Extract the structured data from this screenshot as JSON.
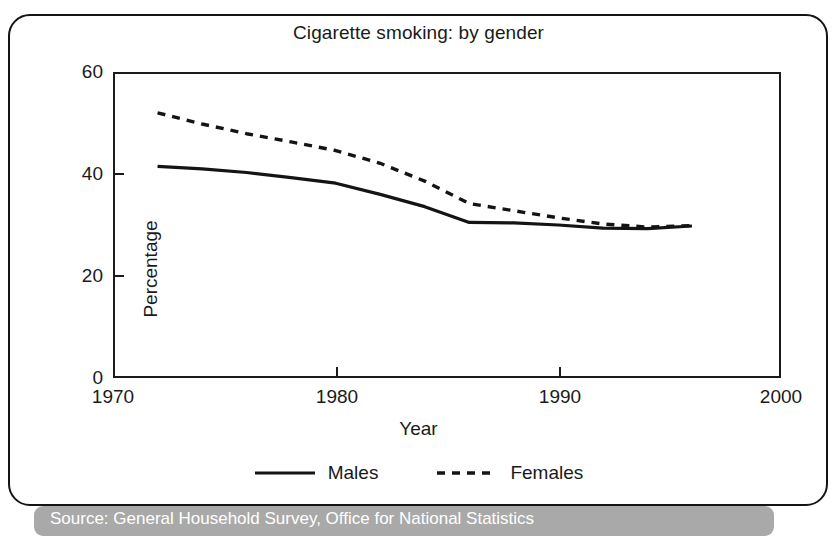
{
  "figure": {
    "title": "Cigarette smoking: by gender",
    "source_text": "Source: General Household Survey, Office for National Statistics"
  },
  "axes": {
    "x_title": "Year",
    "y_title": "Percentage",
    "x_ticks": [
      "1970",
      "1980",
      "1990",
      "2000"
    ],
    "y_ticks": [
      "60",
      "40",
      "20",
      "0"
    ]
  },
  "legend": {
    "items": [
      {
        "label": "Males",
        "style": "solid"
      },
      {
        "label": "Females",
        "style": "dotted"
      }
    ]
  },
  "chart_data": {
    "type": "line",
    "title": "Cigarette smoking: by gender",
    "xlabel": "Year",
    "ylabel": "Percentage",
    "xlim": [
      1970,
      2000
    ],
    "ylim": [
      0,
      60
    ],
    "xticks": [
      1970,
      1980,
      1990,
      2000
    ],
    "yticks": [
      0,
      20,
      40,
      60
    ],
    "grid": false,
    "legend_position": "bottom",
    "x": [
      1972,
      1974,
      1976,
      1978,
      1980,
      1982,
      1984,
      1986,
      1988,
      1990,
      1992,
      1994,
      1996
    ],
    "series": [
      {
        "name": "Males",
        "style": "solid",
        "color": "#141414",
        "values": [
          41.5,
          41.0,
          40.3,
          39.3,
          38.2,
          36.0,
          33.6,
          30.5,
          30.4,
          30.0,
          29.4,
          29.3,
          29.8
        ]
      },
      {
        "name": "Females",
        "style": "dotted",
        "color": "#141414",
        "values": [
          52.0,
          49.8,
          47.9,
          46.3,
          44.6,
          42.1,
          38.6,
          34.2,
          32.8,
          31.4,
          30.2,
          29.6,
          29.9
        ]
      }
    ]
  }
}
